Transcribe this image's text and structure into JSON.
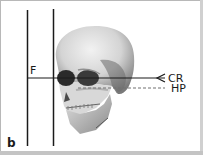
{
  "figure": {
    "panel_label": "b",
    "labels": {
      "frankfort_plane": "F",
      "central_ray": "CR",
      "horizontal_plane": "HP"
    },
    "colors": {
      "line": "#1a1a1a",
      "dashed_line": "#707070",
      "skull_light": "#e6e6e6",
      "skull_shadow": "#5a5a5a",
      "border": "#b8b8b8"
    }
  }
}
